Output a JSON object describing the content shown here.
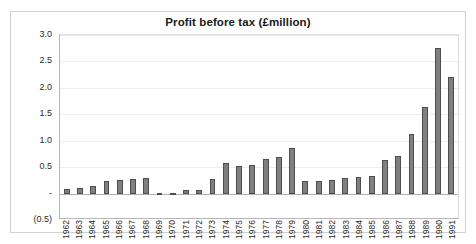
{
  "chart_data": {
    "type": "bar",
    "title": "Profit before tax (£million)",
    "xlabel": "",
    "ylabel": "",
    "ylim": [
      -0.5,
      3.0
    ],
    "grid": true,
    "legend": "none",
    "y_ticks": [
      "3.0",
      "2.5",
      "2.0",
      "1.5",
      "1.0",
      "0.5",
      "-",
      "(0.5)"
    ],
    "y_tick_values": [
      3.0,
      2.5,
      2.0,
      1.5,
      1.0,
      0.5,
      0.0,
      -0.5
    ],
    "categories": [
      "1962",
      "1963",
      "1964",
      "1965",
      "1966",
      "1967",
      "1968",
      "1969",
      "1970",
      "1971",
      "1972",
      "1973",
      "1974",
      "1975",
      "1976",
      "1977",
      "1978",
      "1979",
      "1980",
      "1981",
      "1982",
      "1983",
      "1984",
      "1985",
      "1986",
      "1987",
      "1988",
      "1989",
      "1990",
      "1991"
    ],
    "values": [
      0.09,
      0.1,
      0.15,
      0.24,
      0.25,
      0.27,
      0.29,
      0.02,
      0.01,
      0.06,
      0.07,
      0.28,
      0.58,
      0.52,
      0.54,
      0.65,
      0.7,
      0.87,
      0.24,
      0.24,
      0.25,
      0.29,
      0.32,
      0.34,
      0.64,
      0.71,
      1.12,
      1.64,
      2.75,
      2.2
    ],
    "series": [
      {
        "name": "Profit before tax",
        "values": [
          0.09,
          0.1,
          0.15,
          0.24,
          0.25,
          0.27,
          0.29,
          0.02,
          0.01,
          0.06,
          0.07,
          0.28,
          0.58,
          0.52,
          0.54,
          0.65,
          0.7,
          0.87,
          0.24,
          0.24,
          0.25,
          0.29,
          0.32,
          0.34,
          0.64,
          0.71,
          1.12,
          1.64,
          2.75,
          2.2
        ],
        "color": "#808080",
        "border_color": "#4d4d4d"
      }
    ],
    "colors": {
      "bar_fill": "#808080",
      "bar_border": "#4d4d4d",
      "gridline": "#ededed",
      "axis": "#b0b0b0",
      "frame": "#d2d2d2",
      "background": "#ffffff",
      "text": "#2b2b2b"
    }
  }
}
